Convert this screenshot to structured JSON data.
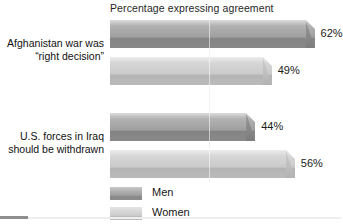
{
  "chart_data": {
    "type": "bar",
    "orientation": "horizontal",
    "title": "Percentage expressing agreement",
    "xlabel": "",
    "ylabel": "",
    "xlim": [
      0,
      70
    ],
    "grid": true,
    "gridlines": [
      30
    ],
    "legend_position": "bottom-left",
    "categories": [
      "Afghanistan war was “right decision”",
      "U.S. forces in Iraq should be withdrawn"
    ],
    "series": [
      {
        "name": "Men",
        "values": [
          62,
          44
        ],
        "color": "#a0a0a0"
      },
      {
        "name": "Women",
        "values": [
          49,
          56
        ],
        "color": "#cccccc"
      }
    ],
    "data_labels": [
      "62%",
      "49%",
      "44%",
      "56%"
    ]
  },
  "title": "Percentage expressing agreement",
  "categories": [
    {
      "line1": "Afghanistan war was",
      "line2": "“right decision”"
    },
    {
      "line1": "U.S. forces in Iraq",
      "line2": "should be withdrawn"
    }
  ],
  "bars": [
    {
      "label": "62%",
      "series": "Men",
      "value": 62
    },
    {
      "label": "49%",
      "series": "Women",
      "value": 49
    },
    {
      "label": "44%",
      "series": "Men",
      "value": 44
    },
    {
      "label": "56%",
      "series": "Women",
      "value": 56
    }
  ],
  "legend": [
    {
      "label": "Men",
      "color": "#a0a0a0"
    },
    {
      "label": "Women",
      "color": "#cccccc"
    }
  ]
}
